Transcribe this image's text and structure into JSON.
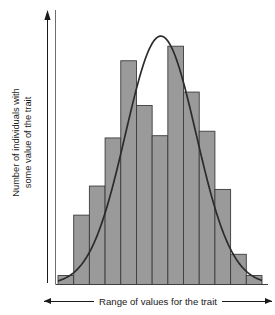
{
  "figure": {
    "background_color": "#ffffff"
  },
  "axes": {
    "y_label_line1": "Number of individuals with",
    "y_label_line2": "some value of the trait",
    "x_label": "Range of values for the trait",
    "x_arrow_left": "arrow-left-icon",
    "x_arrow_right": "arrow-right-icon",
    "y_arrow_up": "arrow-up-icon",
    "axis_color": "#1a1a1a"
  },
  "chart_data": {
    "type": "bar",
    "title": "",
    "xlabel": "Range of values for the trait",
    "ylabel": "Number of individuals with some value of the trait",
    "grid": false,
    "legend": "none",
    "bar_fill_color": "#9a9a9a",
    "bar_stroke_color": "#3c3c3c",
    "curve_color": "#2b2b2b",
    "xlim": [
      0,
      13
    ],
    "ylim": [
      0,
      240
    ],
    "categories": [
      "1",
      "2",
      "3",
      "4",
      "5",
      "6",
      "7",
      "8",
      "9",
      "10",
      "11",
      "12",
      "13"
    ],
    "values": [
      8,
      62,
      88,
      131,
      200,
      160,
      133,
      213,
      172,
      137,
      85,
      27,
      8
    ],
    "series": [
      {
        "name": "Number of individuals",
        "type": "bar",
        "values": [
          8,
          62,
          88,
          131,
          200,
          160,
          133,
          213,
          172,
          137,
          85,
          27,
          8
        ]
      },
      {
        "name": "Normal distribution curve",
        "type": "line",
        "mean": 6.55,
        "sigma": 2.25,
        "peak": 222
      }
    ],
    "annotations": []
  }
}
